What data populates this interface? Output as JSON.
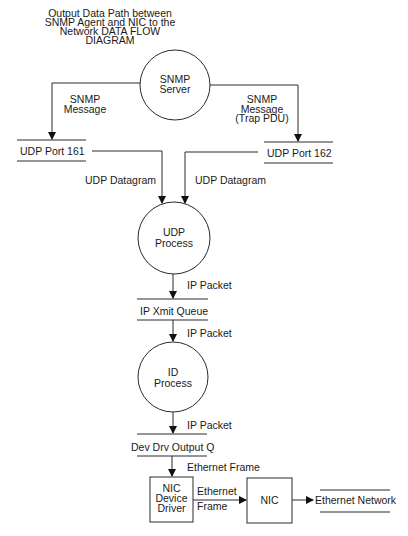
{
  "title": [
    "Output Data Path between",
    "SNMP Agent and NIC to the",
    "Network DATA FLOW",
    "DIAGRAM"
  ],
  "processes": {
    "snmp_server": [
      "SNMP",
      "Server"
    ],
    "udp_process": [
      "UDP",
      "Process"
    ],
    "id_process": [
      "ID",
      "Process"
    ]
  },
  "data_stores": {
    "udp_port_161": "UDP Port 161",
    "udp_port_162": "UDP Port 162",
    "ip_xmit_queue": "IP Xmit Queue",
    "dev_drv_output_q": "Dev Drv Output Q",
    "ethernet_network": "Ethernet Network"
  },
  "boxes": {
    "nic_device_driver": [
      "NIC",
      "Device",
      "Driver"
    ],
    "nic": "NIC"
  },
  "flows": {
    "snmp_message_left": [
      "SNMP",
      "Message"
    ],
    "snmp_message_right": [
      "SNMP",
      "Message",
      "(Trap PDU)"
    ],
    "udp_datagram_left": "UDP Datagram",
    "udp_datagram_right": "UDP Datagram",
    "ip_packet_1": "IP Packet",
    "ip_packet_2": "IP Packet",
    "ip_packet_3": "IP Packet",
    "ethernet_frame_down": "Ethernet Frame",
    "ethernet_frame_right": [
      "Ethernet",
      "Frame"
    ]
  }
}
